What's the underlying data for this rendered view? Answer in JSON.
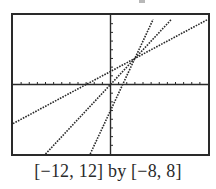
{
  "chart_data": {
    "type": "line",
    "title": "",
    "xlabel": "",
    "ylabel": "",
    "window_caption": "[−12, 12] by [−8, 8]",
    "xlim": [
      -12,
      12
    ],
    "ylim": [
      -8,
      8
    ],
    "xscl": 1,
    "yscl": 1,
    "grid": false,
    "legend": null,
    "series": [
      {
        "name": "y = 0.5x + 1.5",
        "slope": 0.5,
        "intercept": 1.5,
        "x": [
          -12,
          12
        ],
        "y": [
          -4.5,
          7.5
        ],
        "style": "dotted"
      },
      {
        "name": "y = x",
        "slope": 1,
        "intercept": 0,
        "x": [
          -8,
          7.5
        ],
        "y": [
          -8,
          7.5
        ],
        "style": "dotted"
      },
      {
        "name": "y = 2x - 3",
        "slope": 2,
        "intercept": -3,
        "x": [
          -2.5,
          5.25
        ],
        "y": [
          -8,
          7.5
        ],
        "style": "dotted"
      }
    ],
    "annotations": [
      {
        "type": "intersection",
        "x": 3,
        "y": 3
      }
    ]
  },
  "caption": "[−12, 12] by [−8, 8]",
  "colors": {
    "ink": "#2a2a2a",
    "background": "#ffffff"
  }
}
